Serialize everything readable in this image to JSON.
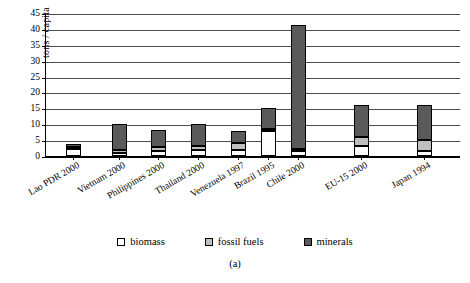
{
  "chart_data": {
    "type": "bar",
    "stacked": true,
    "title": "",
    "subtitle": "",
    "caption": "(a)",
    "xlabel": "",
    "ylabel": "tons / capita",
    "ylim": [
      0,
      45
    ],
    "ytick_step": 5,
    "yticks": [
      0,
      5,
      10,
      15,
      20,
      25,
      30,
      35,
      40,
      45
    ],
    "ytick_labels": [
      "0",
      "5",
      "10",
      "15",
      "20",
      "25",
      "30",
      "35",
      "40",
      "45"
    ],
    "grid": true,
    "grid_axis": "y",
    "legend_position": "bottom",
    "categories": [
      "Lao PDR 2000",
      "Vietnam 2000",
      "Philippines 2000",
      "Thailand 2000",
      "Venezuela 1997",
      "Brazil 1995",
      "Chile 2000",
      "EU-15 2000",
      "Japan 1994"
    ],
    "series": [
      {
        "name": "biomass",
        "color": "#ffffff",
        "values": [
          2.3,
          1.0,
          1.5,
          1.8,
          2.0,
          8.0,
          1.5,
          3.0,
          1.5
        ]
      },
      {
        "name": "fossil fuels",
        "color": "#bfbfbf",
        "values": [
          0.3,
          1.0,
          1.2,
          1.3,
          2.0,
          0.5,
          0.8,
          3.0,
          3.5
        ]
      },
      {
        "name": "minerals",
        "color": "#5a5a5a",
        "values": [
          1.0,
          8.0,
          5.5,
          7.0,
          4.0,
          6.5,
          39.0,
          10.0,
          11.0
        ]
      }
    ],
    "totals": [
      3.6,
      10.0,
      8.2,
      10.1,
      8.0,
      15.0,
      41.3,
      16.0,
      16.0
    ]
  },
  "legend": {
    "items": [
      {
        "label": "biomass",
        "color": "#ffffff"
      },
      {
        "label": "fossil fuels",
        "color": "#bfbfbf"
      },
      {
        "label": "minerals",
        "color": "#5a5a5a"
      }
    ]
  }
}
